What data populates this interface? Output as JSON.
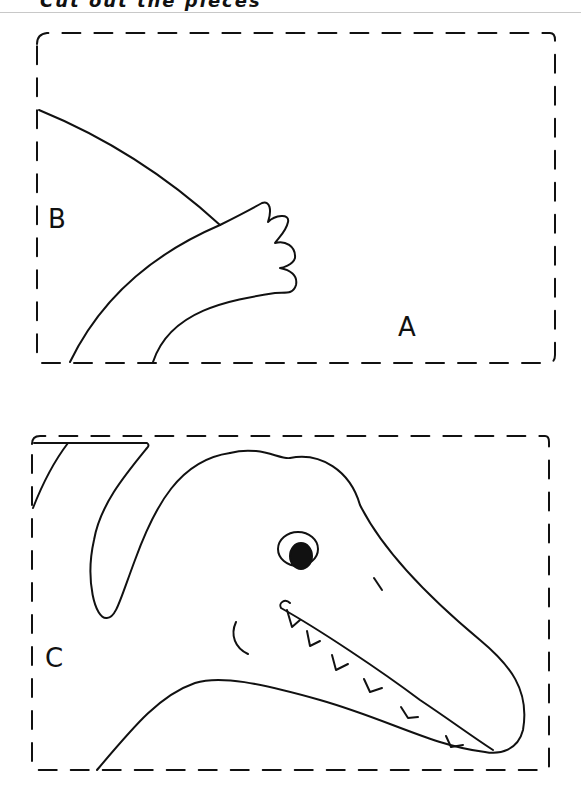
{
  "page": {
    "header_fragment": "Cut out the pieces",
    "panels": [
      {
        "id": "top",
        "labels": {
          "region_a": "A",
          "region_b": "B"
        }
      },
      {
        "id": "bottom",
        "labels": {
          "region_c": "C"
        }
      }
    ]
  },
  "colors": {
    "stroke": "#111111",
    "background": "#ffffff",
    "rule": "#c8c8c8"
  }
}
